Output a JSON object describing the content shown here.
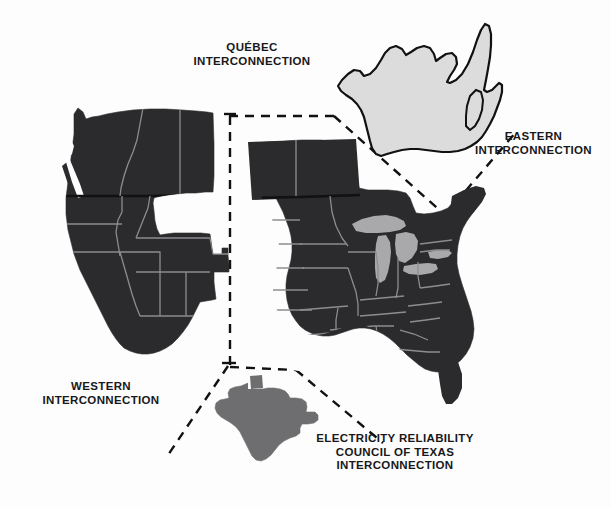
{
  "figure": {
    "kind": "map",
    "background_color": "#fdfdfd"
  },
  "palette": {
    "interconnection_fill": "#2b2b2d",
    "interconnection_fill_light": "#333335",
    "state_border": "#8d8d90",
    "quebec_fill": "#dcdcdc",
    "quebec_outline": "#111111",
    "ercot_fill": "#6e6e70",
    "great_lakes_fill": "#a9a9ab",
    "label_color": "#18181a",
    "leader_line_color": "#111111"
  },
  "labels": {
    "quebec": "QUÉBEC\nINTERCONNECTION",
    "eastern": "EASTERN\nINTERCONNECTION",
    "western": "WESTERN\nINTERCONNECTION",
    "ercot": "ELECTRICITY RELIABILITY\nCOUNCIL OF TEXAS\nINTERCONNECTION"
  },
  "regions": [
    {
      "id": "western-interconnection",
      "name": "Western Interconnection",
      "fill": "#2b2b2d",
      "label_key": "western"
    },
    {
      "id": "eastern-interconnection",
      "name": "Eastern Interconnection",
      "fill": "#2b2b2d",
      "label_key": "eastern"
    },
    {
      "id": "quebec-interconnection",
      "name": "Québec Interconnection",
      "fill": "#dcdcdc",
      "label_key": "quebec"
    },
    {
      "id": "ercot-interconnection",
      "name": "Electricity Reliability Council of Texas Interconnection",
      "fill": "#6e6e70",
      "label_key": "ercot"
    },
    {
      "id": "great-lakes",
      "name": "Great Lakes",
      "fill": "#a9a9ab",
      "label_key": null
    }
  ],
  "leader_lines": {
    "style": "dashed",
    "dash_pattern": "9 7",
    "stroke_width": 2.4
  }
}
